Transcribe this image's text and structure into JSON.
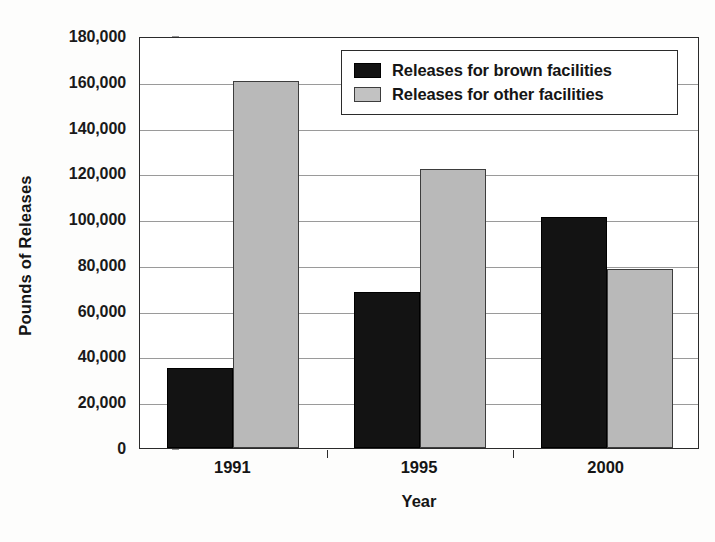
{
  "chart_data": {
    "type": "bar",
    "title": "",
    "xlabel": "Year",
    "ylabel": "Pounds of Releases",
    "categories": [
      "1991",
      "1995",
      "2000"
    ],
    "series": [
      {
        "name": "Releases for brown facilities",
        "color": "#131313",
        "values": [
          35000,
          68000,
          101000
        ]
      },
      {
        "name": "Releases for other facilities",
        "color": "#b9b9b9",
        "values": [
          160500,
          122000,
          78000
        ]
      }
    ],
    "ylim": [
      0,
      180000
    ],
    "ytick_step": 20000,
    "ytick_labels": [
      "180,000",
      "160,000",
      "140,000",
      "120,000",
      "100,000",
      "80,000",
      "60,000",
      "40,000",
      "20,000",
      "0"
    ],
    "ytick_values": [
      180000,
      160000,
      140000,
      120000,
      100000,
      80000,
      60000,
      40000,
      20000,
      0
    ],
    "grid": true,
    "grid_axis": "y",
    "legend_position": "top-right",
    "legend_entries": [
      "Releases for brown facilities",
      "Releases for other facilities"
    ]
  }
}
